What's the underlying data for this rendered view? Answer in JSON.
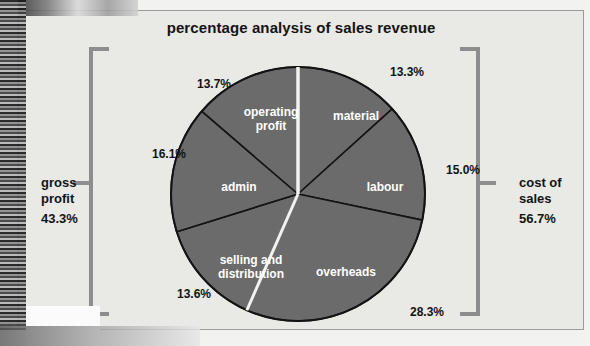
{
  "chart_data": {
    "type": "pie",
    "title": "percentage analysis of sales revenue",
    "categories": [
      "material",
      "labour",
      "overheads",
      "selling and distribution",
      "admin",
      "operating profit"
    ],
    "values": [
      13.3,
      15.0,
      28.3,
      13.6,
      16.1,
      13.7
    ],
    "value_labels": [
      "13.3%",
      "15.0%",
      "28.3%",
      "13.6%",
      "16.1%",
      "13.7%"
    ],
    "slice_color": "#6b6b6b",
    "slice_border_color": "#131313",
    "group_divider_color": "#f2f2f0",
    "label_color": "#ffffff",
    "legend": "none",
    "grid": false,
    "groups": [
      {
        "name": "gross profit",
        "value_label": "43.3%",
        "value": 43.3,
        "side": "left",
        "members": [
          "operating profit",
          "admin",
          "selling and distribution"
        ]
      },
      {
        "name": "cost of sales",
        "value_label": "56.7%",
        "value": 56.7,
        "side": "right",
        "members": [
          "material",
          "labour",
          "overheads"
        ]
      }
    ],
    "start_angle_deg": 0,
    "note": "slices run clockwise from 12 o'clock; white radial gaps separate the gross-profit and cost-of-sales groups"
  },
  "card": {
    "title": "percentage analysis of sales revenue",
    "background": "#e9e9e6",
    "border": "#9b9b9b"
  },
  "slices": [
    {
      "key": "material",
      "name": "material",
      "pct": "13.3%"
    },
    {
      "key": "labour",
      "name": "labour",
      "pct": "15.0%"
    },
    {
      "key": "overheads",
      "name": "overheads",
      "pct": "28.3%"
    },
    {
      "key": "selling",
      "name": "selling and\ndistribution",
      "pct": "13.6%"
    },
    {
      "key": "admin",
      "name": "admin",
      "pct": "16.1%"
    },
    {
      "key": "operating",
      "name": "operating\nprofit",
      "pct": "13.7%"
    }
  ],
  "side_labels": {
    "left": {
      "name": "gross\nprofit",
      "pct": "43.3%"
    },
    "right": {
      "name": "cost of\nsales",
      "pct": "56.7%"
    }
  }
}
